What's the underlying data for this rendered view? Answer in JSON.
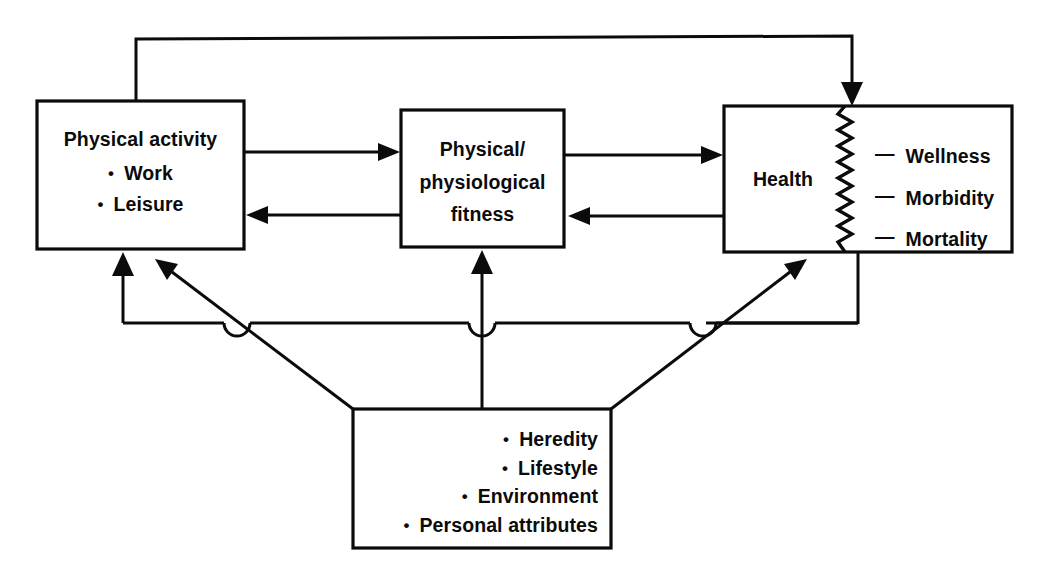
{
  "diagram": {
    "ink_color": "#0b0b0b",
    "background": "#ffffff",
    "nodes": {
      "physical_activity": {
        "title": "Physical activity",
        "bullets": [
          "Work",
          "Leisure"
        ],
        "bullet_glyph": "•"
      },
      "fitness": {
        "line1": "Physical/",
        "line2": "physiological",
        "line3": "fitness"
      },
      "health": {
        "title": "Health",
        "outcomes": [
          "Wellness",
          "Morbidity",
          "Mortality"
        ],
        "dash_glyph": "—"
      },
      "determinants": {
        "bullets": [
          "Heredity",
          "Lifestyle",
          "Environment",
          "Personal attributes"
        ],
        "bullet_glyph": "•"
      }
    },
    "edges": [
      {
        "name": "activity-to-fitness",
        "from": "physical_activity",
        "to": "fitness",
        "direction": "forward"
      },
      {
        "name": "fitness-to-activity",
        "from": "fitness",
        "to": "physical_activity",
        "direction": "backward"
      },
      {
        "name": "fitness-to-health",
        "from": "fitness",
        "to": "health",
        "direction": "forward"
      },
      {
        "name": "health-to-fitness",
        "from": "health",
        "to": "fitness",
        "direction": "backward"
      },
      {
        "name": "activity-to-health-feedback",
        "from": "physical_activity",
        "to": "health",
        "direction": "forward"
      },
      {
        "name": "determinants-to-activity",
        "from": "determinants",
        "to": "physical_activity",
        "direction": "forward"
      },
      {
        "name": "determinants-to-fitness",
        "from": "determinants",
        "to": "fitness",
        "direction": "forward"
      },
      {
        "name": "determinants-to-health",
        "from": "determinants",
        "to": "health",
        "direction": "forward"
      },
      {
        "name": "health-to-determinants-bus",
        "from": "health",
        "to": "determinants",
        "direction": "forward"
      }
    ]
  }
}
